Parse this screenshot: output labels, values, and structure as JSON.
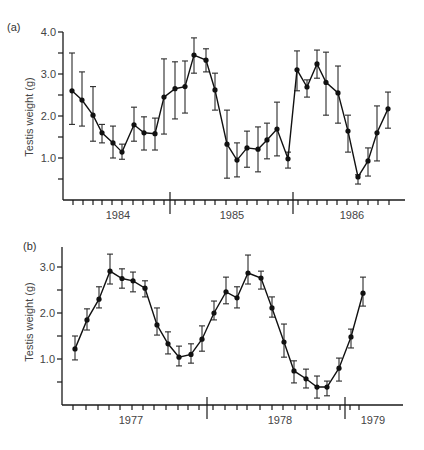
{
  "chart_data": [
    {
      "panel_label": "(a)",
      "type": "line",
      "title": "",
      "xlabel": "",
      "ylabel": "Testis weight (g)",
      "ylim": [
        0,
        4.0
      ],
      "yticks_major": [
        1.0,
        2.0,
        3.0,
        4.0
      ],
      "ytick_labels": [
        "1.0",
        "2.0",
        "3.0",
        "4.0"
      ],
      "yticks_minor": [
        0.5,
        1.5,
        2.5,
        3.5
      ],
      "year_labels": [
        {
          "label": "1984",
          "x": 118
        },
        {
          "label": "1985",
          "x": 232
        },
        {
          "label": "1986",
          "x": 352
        }
      ],
      "year_separators_x": [
        170,
        293
      ],
      "grid": false,
      "legend": null,
      "series": [
        {
          "name": "Testis weight",
          "x_index": [
            1,
            2,
            3,
            4,
            5,
            6,
            7,
            8,
            9,
            10,
            11,
            12,
            13,
            14,
            15,
            16,
            17,
            18,
            19,
            20,
            21,
            22,
            23,
            24,
            25,
            26,
            27,
            28,
            29,
            30,
            31,
            32
          ],
          "values": [
            2.6,
            2.38,
            2.02,
            1.6,
            1.36,
            1.14,
            1.79,
            1.6,
            1.58,
            2.45,
            2.65,
            2.7,
            3.45,
            3.33,
            2.62,
            1.33,
            0.95,
            1.24,
            1.21,
            1.43,
            1.69,
            0.98,
            3.1,
            2.69,
            3.24,
            2.8,
            2.55,
            1.64,
            0.55,
            0.93,
            1.6,
            2.17
          ],
          "err_upper": [
            3.5,
            3.05,
            2.7,
            1.8,
            1.76,
            1.33,
            2.21,
            1.98,
            1.95,
            3.36,
            3.29,
            3.31,
            3.86,
            3.6,
            3.02,
            2.14,
            1.36,
            1.64,
            1.74,
            1.83,
            2.33,
            1.14,
            3.55,
            2.86,
            3.57,
            3.52,
            3.19,
            2.02,
            0.6,
            1.24,
            2.24,
            2.57
          ],
          "err_lower": [
            1.8,
            1.76,
            1.4,
            1.36,
            1.0,
            0.97,
            1.4,
            1.19,
            1.19,
            1.57,
            1.93,
            2.07,
            3.02,
            3.05,
            2.14,
            0.52,
            0.55,
            0.78,
            0.67,
            0.98,
            1.05,
            0.76,
            2.6,
            2.45,
            2.9,
            2.02,
            1.83,
            1.14,
            0.38,
            0.57,
            0.93,
            1.71
          ]
        }
      ]
    },
    {
      "panel_label": "(b)",
      "type": "line",
      "title": "",
      "xlabel": "",
      "ylabel": "Testis weight (g)",
      "ylim": [
        0,
        3.4
      ],
      "yticks_major": [
        1.0,
        2.0,
        3.0
      ],
      "ytick_labels": [
        "1.0",
        "2.0",
        "3.0"
      ],
      "yticks_minor": [
        0.5,
        1.5,
        2.5
      ],
      "year_labels": [
        {
          "label": "1977",
          "x": 131
        },
        {
          "label": "1978",
          "x": 280
        },
        {
          "label": "1979",
          "x": 373
        }
      ],
      "year_separators_x": [
        207,
        345
      ],
      "grid": false,
      "legend": null,
      "series": [
        {
          "name": "Testis weight",
          "x_index": [
            1,
            2,
            3,
            4,
            5,
            6,
            7,
            8,
            9,
            10,
            11,
            12,
            13,
            14,
            15,
            16,
            17,
            18,
            19,
            20,
            21,
            22,
            23,
            24,
            25,
            26
          ],
          "values": [
            1.22,
            1.85,
            2.3,
            2.91,
            2.75,
            2.7,
            2.54,
            1.74,
            1.33,
            1.04,
            1.1,
            1.43,
            2.0,
            2.46,
            2.33,
            2.87,
            2.76,
            2.11,
            1.37,
            0.74,
            0.57,
            0.39,
            0.39,
            0.8,
            1.48,
            2.43
          ],
          "err_upper": [
            1.5,
            2.09,
            2.57,
            3.28,
            2.96,
            2.89,
            2.7,
            2.11,
            1.59,
            1.28,
            1.33,
            1.72,
            2.26,
            2.78,
            2.57,
            3.26,
            2.91,
            2.35,
            1.76,
            0.96,
            0.78,
            0.63,
            0.52,
            1.02,
            1.65,
            2.78
          ],
          "err_lower": [
            0.98,
            1.63,
            2.11,
            2.63,
            2.54,
            2.46,
            2.35,
            1.52,
            1.11,
            0.85,
            0.91,
            1.17,
            1.85,
            2.2,
            2.11,
            2.63,
            2.52,
            1.91,
            1.04,
            0.48,
            0.37,
            0.15,
            0.2,
            0.52,
            1.24,
            2.15
          ]
        }
      ]
    }
  ],
  "panels": [
    {
      "layout": {
        "axis_x": 63,
        "x_axis_y": 200,
        "axis_top_y": 32,
        "axis_right_x": 405,
        "px_per_unit": 42,
        "point_x": [
          72,
          82,
          93,
          102,
          113,
          122,
          134,
          144,
          155,
          164,
          175,
          185,
          194,
          206,
          215,
          227,
          237,
          247,
          258,
          267,
          277,
          288,
          297,
          307,
          317,
          326,
          338,
          348,
          358,
          368,
          377,
          388
        ],
        "tick_x": [
          73,
          83,
          93,
          102,
          112,
          122,
          133,
          143,
          154,
          164,
          175,
          185,
          194,
          205,
          215,
          226,
          237,
          247,
          257,
          268,
          278,
          288,
          298,
          308,
          317,
          327,
          337,
          347,
          358,
          368,
          378,
          389
        ],
        "label_pos": {
          "x": 7,
          "y": 31
        },
        "ylabel_center": {
          "x": 33,
          "y": 117
        }
      }
    },
    {
      "layout": {
        "axis_x": 62,
        "x_axis_y": 405,
        "axis_top_y": 247,
        "axis_right_x": 403,
        "px_per_unit": 46,
        "point_x": [
          75,
          87,
          99,
          110,
          122,
          133,
          145,
          157,
          168,
          179,
          191,
          202,
          214,
          226,
          237,
          248,
          261,
          272,
          284,
          294,
          306,
          317,
          327,
          339,
          351,
          363
        ],
        "tick_x": [
          73,
          86,
          98,
          109,
          120,
          132,
          143,
          154,
          166,
          178,
          188,
          199,
          213,
          225,
          237,
          247,
          260,
          272,
          283,
          295,
          307,
          317,
          329,
          340,
          350,
          359
        ],
        "label_pos": {
          "x": 23,
          "y": 250
        },
        "ylabel_center": {
          "x": 33,
          "y": 322
        }
      }
    }
  ]
}
